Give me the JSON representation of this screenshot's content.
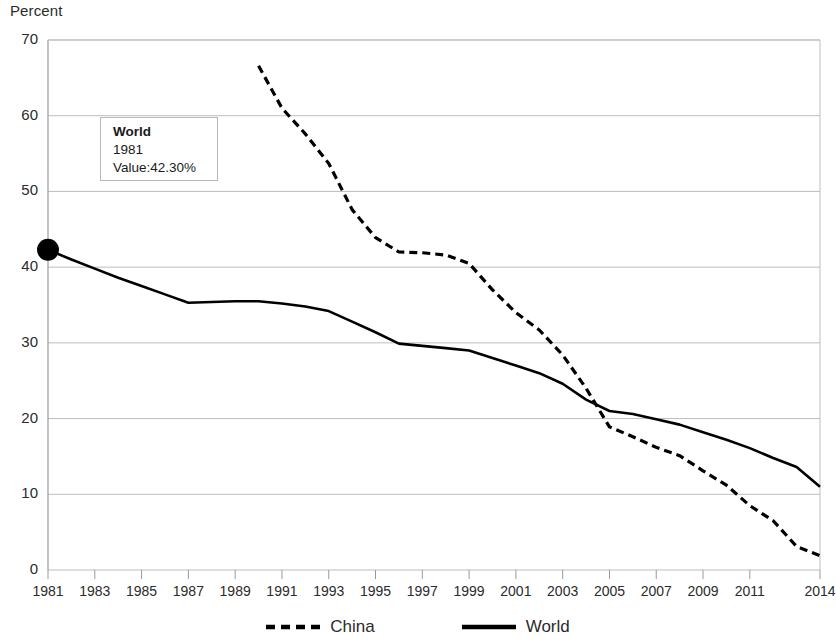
{
  "chart_data": {
    "type": "line",
    "title": "",
    "xlabel": "",
    "ylabel": "Percent",
    "ylim": [
      0,
      70
    ],
    "ytick_values": [
      0,
      10,
      20,
      30,
      40,
      50,
      60,
      70
    ],
    "ytick_labels": [
      "0",
      "10",
      "20",
      "30",
      "40",
      "50",
      "60",
      "70"
    ],
    "xlim": [
      1981,
      2014
    ],
    "xtick_labels": [
      "1981",
      "1983",
      "1985",
      "1987",
      "1989",
      "1991",
      "1993",
      "1995",
      "1997",
      "1999",
      "2001",
      "2003",
      "2005",
      "2007",
      "2009",
      "2011",
      "2014"
    ],
    "xtick_values": [
      1981,
      1983,
      1985,
      1987,
      1989,
      1991,
      1993,
      1995,
      1997,
      1999,
      2001,
      2003,
      2005,
      2007,
      2009,
      2011,
      2014
    ],
    "grid": "horizontal",
    "legend_position": "bottom",
    "series": [
      {
        "name": "China",
        "style": "dashed",
        "color": "#000000",
        "x": [
          1990,
          1991,
          1992,
          1993,
          1994,
          1995,
          1996,
          1997,
          1998,
          1999,
          2000,
          2001,
          2002,
          2003,
          2004,
          2005,
          2006,
          2007,
          2008,
          2009,
          2010,
          2011,
          2012,
          2013,
          2014
        ],
        "values": [
          66.6,
          61.0,
          57.6,
          53.7,
          47.6,
          43.9,
          42.0,
          41.9,
          41.6,
          40.5,
          37.0,
          34.0,
          31.7,
          28.4,
          24.0,
          18.9,
          17.6,
          16.2,
          15.1,
          13.1,
          11.2,
          8.5,
          6.5,
          3.1,
          1.9
        ]
      },
      {
        "name": "World",
        "style": "solid",
        "color": "#000000",
        "x": [
          1981,
          1982,
          1983,
          1984,
          1985,
          1986,
          1987,
          1988,
          1989,
          1990,
          1991,
          1992,
          1993,
          1994,
          1995,
          1996,
          1997,
          1998,
          1999,
          2000,
          2001,
          2002,
          2003,
          2004,
          2005,
          2006,
          2007,
          2008,
          2009,
          2010,
          2011,
          2012,
          2013,
          2014
        ],
        "values": [
          42.3,
          41.0,
          39.8,
          38.6,
          37.5,
          36.4,
          35.3,
          35.4,
          35.5,
          35.5,
          35.2,
          34.8,
          34.2,
          32.8,
          31.4,
          29.9,
          29.6,
          29.3,
          29.0,
          28.0,
          27.0,
          26.0,
          24.6,
          22.5,
          21.0,
          20.6,
          19.9,
          19.2,
          18.2,
          17.2,
          16.1,
          14.8,
          13.6,
          11.0
        ]
      }
    ],
    "marker": {
      "series": "World",
      "x": 1981,
      "value": 42.3
    },
    "tooltip": {
      "series_name": "World",
      "year": "1981",
      "value_text": "Value:42.30%"
    }
  },
  "legend": {
    "items": [
      {
        "label": "China",
        "style": "dashed"
      },
      {
        "label": "World",
        "style": "solid"
      }
    ]
  }
}
